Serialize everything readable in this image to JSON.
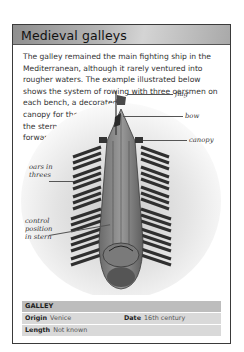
{
  "title": "Medieval galleys",
  "body": {
    "wide_lines": "The galley remained the main fighting ship in the Mediterranean, although it rarely ventured into rougher waters. The example illustrated below shows the system of rowing with three oarsmen on",
    "narrow_lines": "each bench, a decorated canopy for the officers in the stern, and a plainer one forward."
  },
  "illustration": {
    "subject": "galley-top-view",
    "labels": {
      "flag": "flag",
      "bow": "bow",
      "canopy": "canopy",
      "oars": "oars in threes",
      "control": "control position in stern"
    }
  },
  "info": {
    "heading": "GALLEY",
    "origin_label": "Origin",
    "origin_value": "Venice",
    "date_label": "Date",
    "date_value": "16th century",
    "length_label": "Length",
    "length_value": "Not known"
  }
}
